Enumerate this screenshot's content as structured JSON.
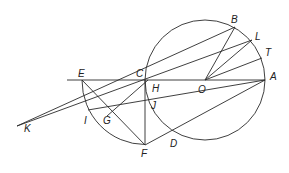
{
  "diagram": {
    "type": "geometry-construction",
    "points": {
      "A": {
        "label": "A",
        "x": 265,
        "y": 80
      },
      "B": {
        "label": "B",
        "x": 235,
        "y": 27
      },
      "L": {
        "label": "L",
        "x": 252,
        "y": 40
      },
      "T": {
        "label": "T",
        "x": 262,
        "y": 58
      },
      "O": {
        "label": "O",
        "x": 205,
        "y": 80
      },
      "C": {
        "label": "C",
        "x": 145,
        "y": 80
      },
      "H": {
        "label": "H",
        "x": 149,
        "y": 80
      },
      "E": {
        "label": "E",
        "x": 82,
        "y": 80
      },
      "J": {
        "label": "J",
        "x": 147,
        "y": 98
      },
      "I": {
        "label": "I",
        "x": 88,
        "y": 110
      },
      "G": {
        "label": "G",
        "x": 107,
        "y": 116
      },
      "F": {
        "label": "F",
        "x": 145,
        "y": 145
      },
      "D": {
        "label": "D",
        "x": 173,
        "y": 135
      },
      "K": {
        "label": "K",
        "x": 17,
        "y": 126
      }
    },
    "labels": [
      "A",
      "B",
      "L",
      "T",
      "O",
      "C",
      "H",
      "E",
      "J",
      "I",
      "G",
      "F",
      "D",
      "K"
    ],
    "circles": [
      {
        "name": "main-circle",
        "center": "O",
        "radius": 60
      },
      {
        "name": "arc-EF",
        "center": "C",
        "radius": 64
      }
    ]
  }
}
